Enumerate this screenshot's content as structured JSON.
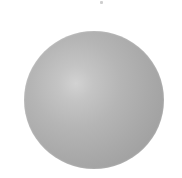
{
  "scene": {
    "background_color": "#ffffff",
    "object": {
      "type": "sphere",
      "shading": "radial-gradient",
      "colors": {
        "highlight": "#d2d2d2",
        "midtone": "#b5b5b5",
        "shadow": "#9f9f9f"
      },
      "center": [
        94,
        100
      ],
      "diameter": 139,
      "highlight_position": [
        76,
        84
      ]
    },
    "artifact": {
      "type": "speck",
      "position": [
        101,
        2
      ],
      "color": "#cfcfcf"
    }
  }
}
